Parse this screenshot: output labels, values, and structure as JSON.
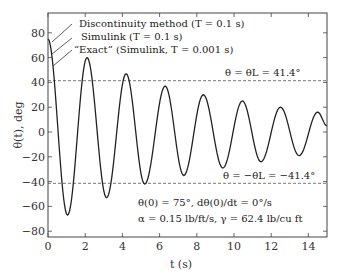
{
  "chart_data": {
    "type": "line",
    "title": "",
    "xlabel": "t (s)",
    "ylabel": "θ(t), deg",
    "xlim": [
      0,
      15
    ],
    "ylim": [
      -85,
      95
    ],
    "x_ticks": [
      0,
      2,
      4,
      6,
      8,
      10,
      12,
      14
    ],
    "y_ticks": [
      -80,
      -60,
      -40,
      -20,
      0,
      20,
      40,
      60,
      80
    ],
    "grid": false,
    "legend_position": "top-left (labels with leader lines)",
    "series": [
      {
        "name": "Discontinuity method (T = 0.1 s)",
        "style": "solid"
      },
      {
        "name": "Simulink (T = 0.1 s)",
        "style": "solid"
      },
      {
        "name": "\"Exact\" (Simulink, T = 0.001 s)",
        "style": "solid"
      }
    ],
    "extrema": {
      "t": [
        0,
        1.05,
        2.1,
        3.15,
        4.2,
        5.2,
        6.3,
        7.3,
        8.35,
        9.4,
        10.45,
        11.45,
        12.5,
        13.5,
        14.5,
        15
      ],
      "theta": [
        75,
        -67,
        60,
        -53,
        47,
        -42,
        37,
        -35,
        30,
        -29,
        25,
        -24,
        20,
        -19,
        16,
        5
      ]
    },
    "reference_lines": [
      {
        "y": 41.4,
        "style": "dashed",
        "label": "θ = θL = 41.4°"
      },
      {
        "y": -41.4,
        "style": "dashed",
        "label": "θ = −θL = −41.4°"
      }
    ],
    "annotations": [
      "θ(0) = 75°, dθ(0)/dt = 0°/s",
      "α = 0.15 lb/ft/s, γ = 62.4 lb/cu ft"
    ]
  },
  "labels": {
    "legend1": "Discontinuity method (T = 0.1 s)",
    "legend2": "Simulink (T = 0.1 s)",
    "legend3": "“Exact” (Simulink, T = 0.001 s)",
    "upper_limit": "θ = θL = 41.4°",
    "lower_limit": "θ = −θL = −41.4°",
    "init_cond": "θ(0) = 75°, dθ(0)/dt = 0°/s",
    "params": "α = 0.15 lb/ft/s, γ = 62.4 lb/cu ft",
    "xlabel": "t (s)",
    "ylabel": "θ(t), deg"
  }
}
